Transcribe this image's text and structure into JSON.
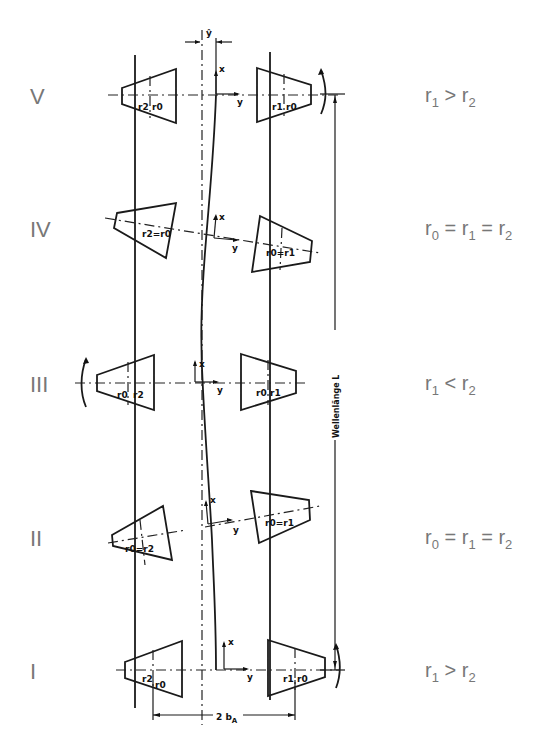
{
  "rows": [
    {
      "id": "V",
      "label": "V",
      "condition": {
        "a": "r",
        "a_sub": "1",
        "op": ">",
        "b": "r",
        "b_sub": "2",
        "c": "",
        "c_sub": "",
        "op2": ""
      },
      "left_tags": [
        "r2",
        "r0"
      ],
      "right_tags": [
        "r1",
        "r0"
      ]
    },
    {
      "id": "IV",
      "label": "IV",
      "condition": {
        "a": "r",
        "a_sub": "0",
        "op": "=",
        "b": "r",
        "b_sub": "1",
        "op2": "=",
        "c": "r",
        "c_sub": "2"
      },
      "left_tags": [
        "r2",
        "r0"
      ],
      "right_tags": [
        "r0",
        "r1"
      ]
    },
    {
      "id": "III",
      "label": "III",
      "condition": {
        "a": "r",
        "a_sub": "1",
        "op": "<",
        "b": "r",
        "b_sub": "2",
        "c": "",
        "c_sub": "",
        "op2": ""
      },
      "left_tags": [
        "r0",
        "r2"
      ],
      "right_tags": [
        "r0",
        "r1"
      ]
    },
    {
      "id": "II",
      "label": "II",
      "condition": {
        "a": "r",
        "a_sub": "0",
        "op": "=",
        "b": "r",
        "b_sub": "1",
        "op2": "=",
        "c": "r",
        "c_sub": "2"
      },
      "left_tags": [
        "r0",
        "r2"
      ],
      "right_tags": [
        "r0",
        "r1"
      ]
    },
    {
      "id": "I",
      "label": "I",
      "condition": {
        "a": "r",
        "a_sub": "1",
        "op": ">",
        "b": "r",
        "b_sub": "2",
        "c": "",
        "c_sub": "",
        "op2": ""
      },
      "left_tags": [
        "r2",
        "r0"
      ],
      "right_tags": [
        "r1",
        "r0"
      ]
    }
  ],
  "axes": {
    "x": "x",
    "y": "y",
    "y_hat": "ŷ"
  },
  "dimensions": {
    "wavelength_label": "Wellenlänge  L",
    "track_width_label": "2 b",
    "track_width_sub": "A"
  }
}
